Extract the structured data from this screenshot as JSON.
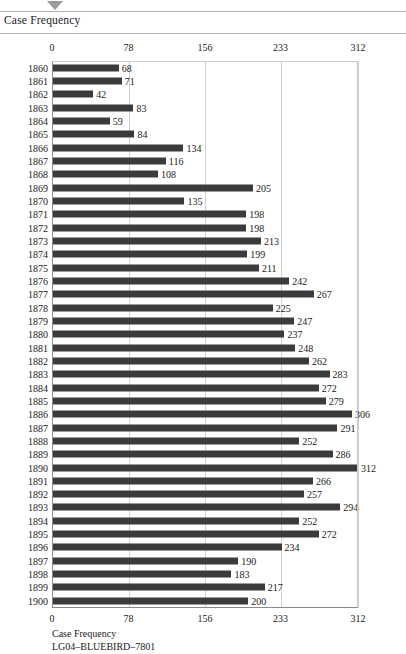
{
  "header": {
    "title": "Case Frequency",
    "marker_icon": "triangle-down-icon"
  },
  "footer": {
    "axis_title": "Case Frequency",
    "code": "LG04–BLUEBIRD–7801"
  },
  "chart_data": {
    "type": "bar",
    "orientation": "horizontal",
    "title": "Case Frequency",
    "xlabel": "Case Frequency",
    "ylabel": "",
    "xlim": [
      0,
      312
    ],
    "ticks": [
      0,
      78,
      156,
      233,
      312
    ],
    "tick_labels": [
      "0",
      "78",
      "156",
      "233",
      "312"
    ],
    "grid": true,
    "grid_axis": "x",
    "legend": false,
    "bar_color": "#3b3b3b",
    "categories": [
      "1860",
      "1861",
      "1862",
      "1863",
      "1864",
      "1865",
      "1866",
      "1867",
      "1868",
      "1869",
      "1870",
      "1871",
      "1872",
      "1873",
      "1874",
      "1875",
      "1876",
      "1877",
      "1878",
      "1879",
      "1880",
      "1881",
      "1882",
      "1883",
      "1884",
      "1885",
      "1886",
      "1887",
      "1888",
      "1889",
      "1890",
      "1891",
      "1892",
      "1893",
      "1894",
      "1895",
      "1896",
      "1897",
      "1898",
      "1899",
      "1900"
    ],
    "values": [
      68,
      71,
      42,
      83,
      59,
      84,
      134,
      116,
      108,
      205,
      135,
      198,
      198,
      213,
      199,
      211,
      242,
      267,
      225,
      247,
      237,
      248,
      262,
      283,
      272,
      279,
      306,
      291,
      252,
      286,
      312,
      266,
      257,
      294,
      252,
      272,
      234,
      190,
      183,
      217,
      200
    ]
  }
}
